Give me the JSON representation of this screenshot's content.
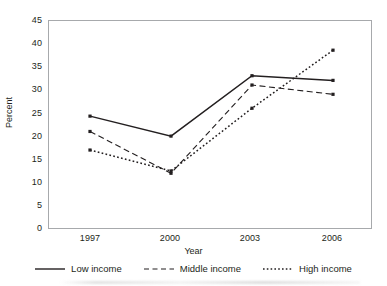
{
  "chart_data": {
    "type": "line",
    "title": "",
    "xlabel": "Year",
    "ylabel": "Percent",
    "categories": [
      "1997",
      "2000",
      "2003",
      "2006"
    ],
    "x": [
      1997,
      2000,
      2003,
      2006
    ],
    "ylim": [
      0,
      45
    ],
    "yticks": [
      0,
      5,
      10,
      15,
      20,
      25,
      30,
      35,
      40,
      45
    ],
    "ytick_labels": [
      "0",
      "5",
      "10",
      "15",
      "20",
      "25",
      "30",
      "35",
      "40",
      "45"
    ],
    "grid": false,
    "legend_position": "bottom",
    "marker": "square",
    "series": [
      {
        "name": "Low income",
        "values": [
          24.3,
          20,
          33,
          32
        ],
        "linestyle": "solid",
        "color": "#231f20"
      },
      {
        "name": "Middle income",
        "values": [
          21,
          12,
          31,
          29
        ],
        "linestyle": "dashed",
        "color": "#231f20"
      },
      {
        "name": "High income",
        "values": [
          17,
          12.5,
          26,
          38.5
        ],
        "linestyle": "dotted",
        "color": "#231f20"
      }
    ]
  },
  "axes": {
    "y_title": "Percent",
    "x_title": "Year",
    "y_tick_0": "0",
    "y_tick_1": "5",
    "y_tick_2": "10",
    "y_tick_3": "15",
    "y_tick_4": "20",
    "y_tick_5": "25",
    "y_tick_6": "30",
    "y_tick_7": "35",
    "y_tick_8": "40",
    "y_tick_9": "45",
    "x_tick_0": "1997",
    "x_tick_1": "2000",
    "x_tick_2": "2003",
    "x_tick_3": "2006"
  },
  "legend": {
    "items": [
      {
        "label": "Low income",
        "style": "solid"
      },
      {
        "label": "Middle income",
        "style": "dashed"
      },
      {
        "label": "High income",
        "style": "dotted"
      }
    ]
  },
  "colors": {
    "ink": "#231f20",
    "frame": "#a7a9ac",
    "background": "#ffffff"
  }
}
